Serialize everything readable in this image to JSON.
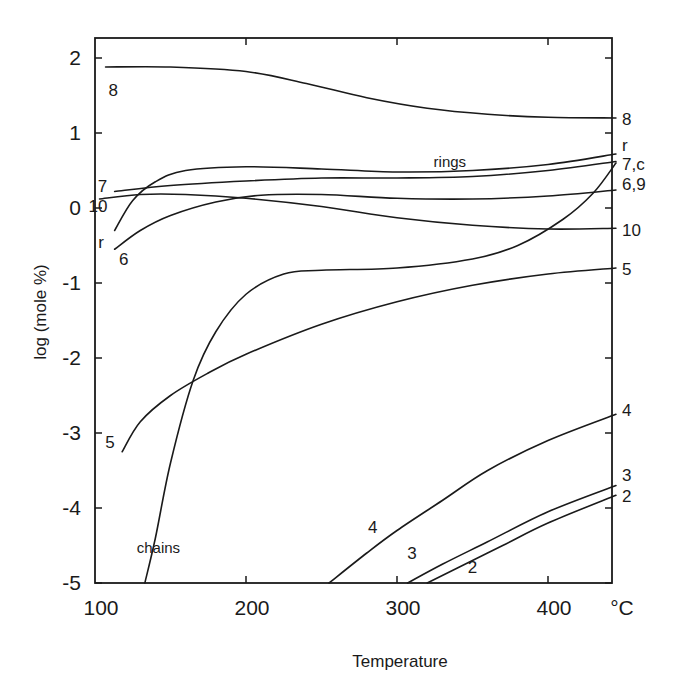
{
  "chart_data": {
    "type": "line",
    "title": "",
    "xlabel": "Temperature",
    "xunit": "°C",
    "ylabel": "log (mole %)",
    "xlim": [
      100,
      445
    ],
    "ylim": [
      -5,
      2.2
    ],
    "grid": false,
    "legend": "inline curve labels",
    "x_ticks": [
      100,
      200,
      300,
      400
    ],
    "x_tick_labels": [
      "100",
      "200",
      "300",
      "400"
    ],
    "y_ticks": [
      2,
      1,
      0,
      -1,
      -2,
      -3,
      -4,
      -5
    ],
    "y_tick_labels": [
      "2",
      "1",
      "0",
      "-1",
      "-2",
      "-3",
      "-4",
      "-5"
    ],
    "annotations": [
      {
        "text": "rings",
        "x": 335,
        "y": 0.55
      },
      {
        "text": "chains",
        "x": 142,
        "y": -4.6
      }
    ],
    "series": [
      {
        "name": "8",
        "left_label": "8",
        "right_label": "8",
        "points": [
          [
            107,
            1.88
          ],
          [
            150,
            1.88
          ],
          [
            200,
            1.82
          ],
          [
            240,
            1.66
          ],
          [
            280,
            1.47
          ],
          [
            320,
            1.33
          ],
          [
            360,
            1.25
          ],
          [
            400,
            1.21
          ],
          [
            445,
            1.2
          ]
        ]
      },
      {
        "name": "r (rings)",
        "left_label": "r",
        "right_label": "r",
        "points": [
          [
            113,
            -0.3
          ],
          [
            125,
            0.1
          ],
          [
            140,
            0.35
          ],
          [
            160,
            0.5
          ],
          [
            200,
            0.55
          ],
          [
            250,
            0.52
          ],
          [
            300,
            0.48
          ],
          [
            350,
            0.5
          ],
          [
            400,
            0.58
          ],
          [
            445,
            0.72
          ]
        ]
      },
      {
        "name": "7",
        "left_label": "7",
        "right_label": "7,c",
        "points": [
          [
            113,
            0.22
          ],
          [
            150,
            0.3
          ],
          [
            200,
            0.36
          ],
          [
            250,
            0.4
          ],
          [
            300,
            0.4
          ],
          [
            350,
            0.42
          ],
          [
            400,
            0.5
          ],
          [
            445,
            0.62
          ]
        ]
      },
      {
        "name": "6",
        "left_label": "6",
        "right_label": "6,9",
        "points": [
          [
            113,
            -0.55
          ],
          [
            130,
            -0.3
          ],
          [
            150,
            -0.1
          ],
          [
            180,
            0.08
          ],
          [
            210,
            0.17
          ],
          [
            250,
            0.18
          ],
          [
            300,
            0.13
          ],
          [
            350,
            0.12
          ],
          [
            400,
            0.16
          ],
          [
            445,
            0.24
          ]
        ]
      },
      {
        "name": "10",
        "left_label": "10",
        "right_label": "10",
        "points": [
          [
            103,
            0.12
          ],
          [
            130,
            0.18
          ],
          [
            160,
            0.18
          ],
          [
            200,
            0.13
          ],
          [
            250,
            0.02
          ],
          [
            300,
            -0.13
          ],
          [
            350,
            -0.23
          ],
          [
            400,
            -0.28
          ],
          [
            445,
            -0.27
          ]
        ]
      },
      {
        "name": "chains",
        "left_label": "",
        "right_label": "c",
        "points": [
          [
            133,
            -5.0
          ],
          [
            140,
            -4.4
          ],
          [
            150,
            -3.4
          ],
          [
            165,
            -2.3
          ],
          [
            180,
            -1.65
          ],
          [
            200,
            -1.15
          ],
          [
            225,
            -0.88
          ],
          [
            250,
            -0.83
          ],
          [
            300,
            -0.8
          ],
          [
            350,
            -0.68
          ],
          [
            380,
            -0.5
          ],
          [
            410,
            -0.15
          ],
          [
            430,
            0.2
          ],
          [
            445,
            0.6
          ]
        ]
      },
      {
        "name": "5",
        "left_label": "5",
        "right_label": "5",
        "points": [
          [
            118,
            -3.25
          ],
          [
            130,
            -2.85
          ],
          [
            150,
            -2.5
          ],
          [
            175,
            -2.2
          ],
          [
            200,
            -1.95
          ],
          [
            250,
            -1.55
          ],
          [
            300,
            -1.25
          ],
          [
            350,
            -1.03
          ],
          [
            400,
            -0.88
          ],
          [
            445,
            -0.8
          ]
        ]
      },
      {
        "name": "4",
        "left_label": "4",
        "right_label": "4",
        "points": [
          [
            255,
            -5.0
          ],
          [
            280,
            -4.6
          ],
          [
            300,
            -4.3
          ],
          [
            330,
            -3.9
          ],
          [
            360,
            -3.5
          ],
          [
            400,
            -3.1
          ],
          [
            445,
            -2.75
          ]
        ]
      },
      {
        "name": "3",
        "left_label": "3",
        "right_label": "3",
        "points": [
          [
            307,
            -5.0
          ],
          [
            330,
            -4.75
          ],
          [
            360,
            -4.45
          ],
          [
            400,
            -4.05
          ],
          [
            445,
            -3.7
          ]
        ]
      },
      {
        "name": "2",
        "left_label": "2",
        "right_label": "2",
        "points": [
          [
            320,
            -5.0
          ],
          [
            340,
            -4.8
          ],
          [
            370,
            -4.5
          ],
          [
            400,
            -4.2
          ],
          [
            445,
            -3.83
          ]
        ]
      }
    ],
    "left_labels": [
      {
        "text": "8",
        "x": 112,
        "y": 1.57
      },
      {
        "text": "7",
        "x": 105,
        "y": 0.3
      },
      {
        "text": "10",
        "x": 102,
        "y": 0.03
      },
      {
        "text": "r",
        "x": 104,
        "y": -0.45
      },
      {
        "text": "6",
        "x": 119,
        "y": -0.68
      },
      {
        "text": "5",
        "x": 110,
        "y": -3.12
      },
      {
        "text": "4",
        "x": 284,
        "y": -4.25
      },
      {
        "text": "3",
        "x": 310,
        "y": -4.6
      },
      {
        "text": "2",
        "x": 350,
        "y": -4.78
      }
    ],
    "right_labels": [
      {
        "text": "8",
        "y": 1.2
      },
      {
        "text": "r",
        "y": 0.85
      },
      {
        "text": "7,c",
        "y": 0.6
      },
      {
        "text": "6,9",
        "y": 0.33
      },
      {
        "text": "10",
        "y": -0.28
      },
      {
        "text": "5",
        "y": -0.8
      },
      {
        "text": "4",
        "y": -2.68
      },
      {
        "text": "3",
        "y": -3.55
      },
      {
        "text": "2",
        "y": -3.83
      }
    ]
  }
}
